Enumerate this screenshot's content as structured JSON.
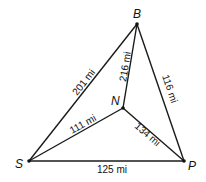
{
  "diagram": {
    "type": "weighted-graph",
    "vertices": [
      {
        "id": "B",
        "label": "B"
      },
      {
        "id": "N",
        "label": "N"
      },
      {
        "id": "S",
        "label": "S"
      },
      {
        "id": "P",
        "label": "P"
      }
    ],
    "edges": [
      {
        "from": "S",
        "to": "B",
        "label": "201 mi"
      },
      {
        "from": "N",
        "to": "B",
        "label": "216 mi"
      },
      {
        "from": "B",
        "to": "P",
        "label": "116 mi"
      },
      {
        "from": "S",
        "to": "N",
        "label": "111 mi"
      },
      {
        "from": "N",
        "to": "P",
        "label": "134 mi"
      },
      {
        "from": "S",
        "to": "P",
        "label": "125 mi"
      }
    ]
  }
}
